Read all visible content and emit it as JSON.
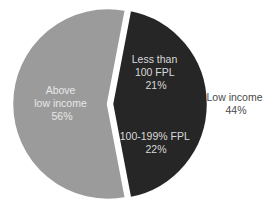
{
  "chart_data": {
    "type": "pie",
    "title": "",
    "slices": [
      {
        "name": "Above low income",
        "label_lines": [
          "Above",
          "low income",
          "56%"
        ],
        "value": 56,
        "color": "#9b9b9b",
        "exploded": false
      },
      {
        "name": "Low income",
        "label_lines": [
          "Low income",
          "44%"
        ],
        "value": 44,
        "color": "#262626",
        "exploded": true,
        "label_position": "outside-right",
        "subslices": [
          {
            "name": "Less than 100 FPL",
            "label_lines": [
              "Less than",
              "100 FPL",
              "21%"
            ],
            "value": 21
          },
          {
            "name": "100-199% FPL",
            "label_lines": [
              "100-199% FPL",
              "22%"
            ],
            "value": 22
          }
        ]
      }
    ],
    "legend": "none",
    "text_colors": {
      "inside_dark_slice": "#d9d9d9",
      "inside_gray_slice": "#e8e8e8",
      "outside": "#4a4a4a"
    }
  }
}
